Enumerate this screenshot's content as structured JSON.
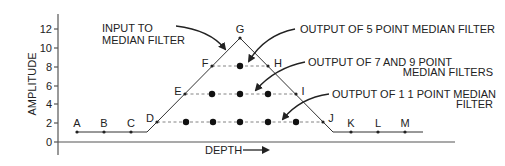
{
  "figure": {
    "y_axis_label": "AMPLITUDE",
    "x_axis_label": "DEPTH",
    "y_ticks": [
      {
        "label": "12",
        "value": 12
      },
      {
        "label": "10",
        "value": 10
      },
      {
        "label": "8",
        "value": 8
      },
      {
        "label": "6",
        "value": 6
      },
      {
        "label": "4",
        "value": 4
      },
      {
        "label": "2",
        "value": 2
      },
      {
        "label": "0",
        "value": 0
      }
    ],
    "points": [
      {
        "label": "A",
        "x": 1,
        "y": 1
      },
      {
        "label": "B",
        "x": 2,
        "y": 1
      },
      {
        "label": "C",
        "x": 3,
        "y": 1
      },
      {
        "label": "D",
        "x": 4,
        "y": 2
      },
      {
        "label": "E",
        "x": 5,
        "y": 5
      },
      {
        "label": "F",
        "x": 6,
        "y": 8
      },
      {
        "label": "G",
        "x": 7,
        "y": 11
      },
      {
        "label": "H",
        "x": 8,
        "y": 8
      },
      {
        "label": "I",
        "x": 9,
        "y": 5
      },
      {
        "label": "J",
        "x": 10,
        "y": 2
      },
      {
        "label": "K",
        "x": 11,
        "y": 1
      },
      {
        "label": "L",
        "x": 12,
        "y": 1
      },
      {
        "label": "M",
        "x": 13,
        "y": 1
      }
    ],
    "annotations": {
      "input": [
        "INPUT TO",
        "MEDIAN FILTER"
      ],
      "out5": [
        "OUTPUT OF 5 POINT MEDIAN FILTER"
      ],
      "out79": [
        "OUTPUT OF 7 AND 9 POINT",
        "MEDIAN FILTERS"
      ],
      "out11": [
        "OUTPUT OF 1 1 POINT MEDIAN",
        "FILTER"
      ]
    },
    "median_outputs": [
      {
        "filter": "5 point",
        "level": 8,
        "dots_at_points": [
          "G"
        ]
      },
      {
        "filter": "7 and 9 point",
        "level": 5,
        "dots_at_points": [
          "F",
          "G",
          "H"
        ]
      },
      {
        "filter": "11 point",
        "level": 2,
        "dots_at_points": [
          "E",
          "F",
          "G",
          "H",
          "I"
        ]
      }
    ]
  }
}
